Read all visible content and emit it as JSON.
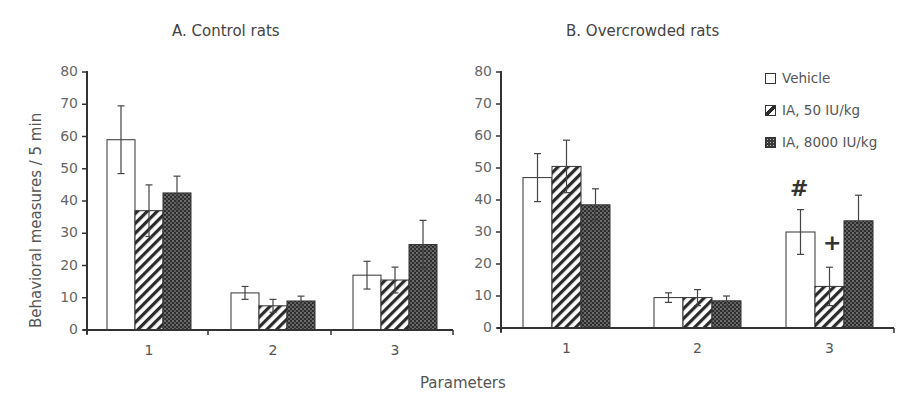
{
  "chart_data": [
    {
      "type": "bar",
      "title": "A. Control rats",
      "xlabel": "Parameters",
      "ylabel": "Behavioral measures / 5 min",
      "categories": [
        "1",
        "2",
        "3"
      ],
      "ylim": [
        0,
        80
      ],
      "yticks": [
        0,
        10,
        20,
        30,
        40,
        50,
        60,
        70,
        80
      ],
      "grid": false,
      "series": [
        {
          "name": "Vehicle",
          "values": [
            59,
            11.5,
            17
          ],
          "errors": [
            10.5,
            2,
            4.3
          ]
        },
        {
          "name": "IA, 50 IU/kg",
          "values": [
            37,
            7.5,
            15.5
          ],
          "errors": [
            8,
            2,
            4
          ]
        },
        {
          "name": "IA, 8000 IU/kg",
          "values": [
            42.5,
            9,
            26.5
          ],
          "errors": [
            5.2,
            1.5,
            7.5
          ]
        }
      ],
      "annotations": []
    },
    {
      "type": "bar",
      "title": "B. Overcrowded rats",
      "xlabel": "Parameters",
      "ylabel": "Behavioral measures / 5 min",
      "categories": [
        "1",
        "2",
        "3"
      ],
      "ylim": [
        0,
        80
      ],
      "yticks": [
        0,
        10,
        20,
        30,
        40,
        50,
        60,
        70,
        80
      ],
      "grid": false,
      "legend_position": "upper right",
      "series": [
        {
          "name": "Vehicle",
          "values": [
            47,
            9.5,
            30
          ],
          "errors": [
            7.5,
            1.5,
            7
          ]
        },
        {
          "name": "IA, 50 IU/kg",
          "values": [
            50.5,
            9.5,
            13
          ],
          "errors": [
            8.2,
            2.5,
            6
          ]
        },
        {
          "name": "IA, 8000 IU/kg",
          "values": [
            38.5,
            8.5,
            33.5
          ],
          "errors": [
            5,
            1.5,
            8
          ]
        }
      ],
      "annotations": [
        {
          "text": "#",
          "category": "3",
          "series": "Vehicle"
        },
        {
          "text": "+",
          "category": "3",
          "series": "IA, 50 IU/kg"
        }
      ]
    }
  ],
  "panels": {
    "a": {
      "title": "A. Control rats"
    },
    "b": {
      "title": "B. Overcrowded rats"
    }
  },
  "axes": {
    "ylabel": "Behavioral measures / 5 min",
    "xlabel": "Parameters",
    "yticks": [
      "0",
      "10",
      "20",
      "30",
      "40",
      "50",
      "60",
      "70",
      "80"
    ],
    "xticks": [
      "1",
      "2",
      "3"
    ]
  },
  "legend": {
    "items": [
      {
        "label": "Vehicle",
        "pattern": "white"
      },
      {
        "label": "IA, 50 IU/kg",
        "pattern": "hatch"
      },
      {
        "label": "IA, 8000 IU/kg",
        "pattern": "dots"
      }
    ]
  },
  "annotations": {
    "hash": "#",
    "plus": "+"
  },
  "colors": {
    "axis": "#333333",
    "bar_outline": "#333333",
    "dark_fill": "#3a3a3a",
    "text": "#555555"
  }
}
